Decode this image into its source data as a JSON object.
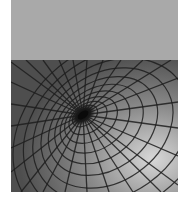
{
  "image": {
    "description": "Grayscale illustration: flat light-gray upper band above a warped grid spiraling into a dark central well",
    "colors": {
      "background": "#ffffff",
      "upper_band": "#a9a9a9",
      "lower_base": "#5a5a5a",
      "grid_line": "#1e1e1e",
      "highlight": "#d8d8d8",
      "well_center": "#0a0a0a"
    }
  }
}
